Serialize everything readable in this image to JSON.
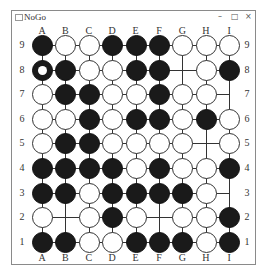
{
  "window": {
    "title": "NoGo",
    "controls": {
      "minimize": "–",
      "maximize": "□",
      "close": "×"
    }
  },
  "board": {
    "size": 9,
    "columns": [
      "A",
      "B",
      "C",
      "D",
      "E",
      "F",
      "G",
      "H",
      "I"
    ],
    "rows": [
      "9",
      "8",
      "7",
      "6",
      "5",
      "4",
      "3",
      "2",
      "1"
    ],
    "last_move": "A8",
    "stones": [
      [
        "B",
        "W",
        "W",
        "B",
        "B",
        "B",
        "W",
        "W",
        "W"
      ],
      [
        "B",
        "B",
        "W",
        "W",
        "B",
        "B",
        ".",
        "W",
        "B"
      ],
      [
        "W",
        "B",
        "B",
        "W",
        "W",
        "B",
        "W",
        "W",
        "."
      ],
      [
        "W",
        "W",
        "B",
        "W",
        "B",
        "B",
        "W",
        "B",
        "W"
      ],
      [
        "W",
        "B",
        "B",
        "W",
        "W",
        "W",
        "W",
        ".",
        "W"
      ],
      [
        "B",
        "B",
        "B",
        "B",
        "W",
        "B",
        "W",
        "W",
        "B"
      ],
      [
        "B",
        "B",
        "W",
        "B",
        "B",
        "B",
        "B",
        "W",
        "."
      ],
      [
        "W",
        ".",
        "W",
        "B",
        "W",
        ".",
        "W",
        "W",
        "B"
      ],
      [
        "B",
        "B",
        "W",
        "W",
        "B",
        "B",
        "B",
        "W",
        "B"
      ]
    ]
  },
  "colors": {
    "black_stone": "#1a1a1a",
    "white_stone": "#ffffff",
    "grid": "#333333"
  }
}
